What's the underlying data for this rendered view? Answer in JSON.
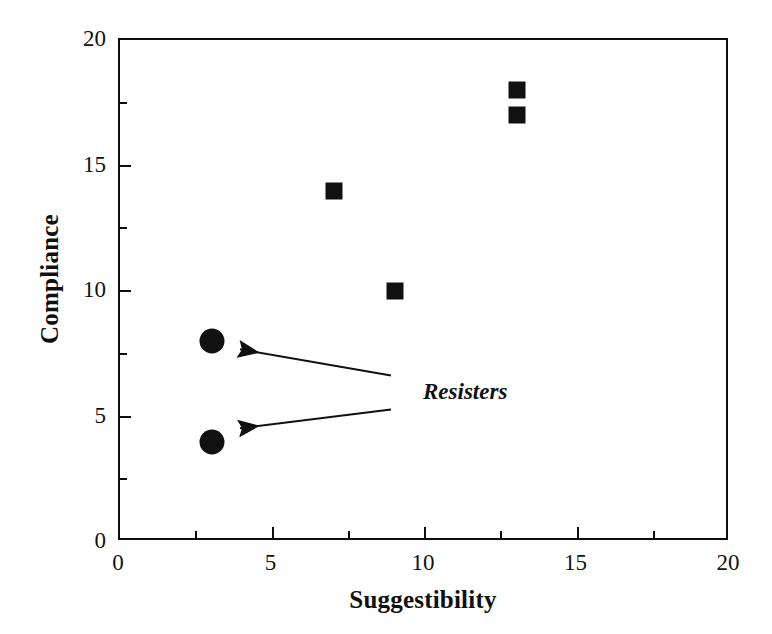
{
  "chart_data": {
    "type": "scatter",
    "title": "",
    "xlabel": "Suggestibility",
    "ylabel": "Compliance",
    "xlim": [
      0,
      20
    ],
    "ylim": [
      0,
      20
    ],
    "xticks": [
      0,
      5,
      10,
      15,
      20
    ],
    "yticks": [
      0,
      5,
      10,
      15,
      20
    ],
    "xtick_labels": [
      "0",
      "5",
      "10",
      "15",
      "20"
    ],
    "ytick_labels": [
      "0",
      "5",
      "10",
      "15",
      "20"
    ],
    "xminor_ticks": [
      2.5,
      7.5,
      12.5,
      17.5
    ],
    "yminor_ticks": [
      2.5,
      7.5,
      12.5,
      17.5
    ],
    "grid": false,
    "legend": false,
    "series": [
      {
        "name": "Compliers",
        "marker": "square",
        "color": "#111111",
        "points": [
          {
            "x": 7,
            "y": 14
          },
          {
            "x": 9,
            "y": 10
          },
          {
            "x": 13,
            "y": 18
          },
          {
            "x": 13,
            "y": 17
          }
        ]
      },
      {
        "name": "Resisters",
        "marker": "circle",
        "color": "#111111",
        "points": [
          {
            "x": 3,
            "y": 8
          },
          {
            "x": 3,
            "y": 4
          }
        ]
      }
    ],
    "annotations": [
      {
        "text": "Resisters",
        "x": 10.0,
        "y": 5.85,
        "arrows": [
          {
            "from_x": 8.95,
            "from_y": 6.55,
            "to_x": 4.0,
            "to_y": 7.6
          },
          {
            "from_x": 8.95,
            "from_y": 5.2,
            "to_x": 4.0,
            "to_y": 4.45
          }
        ]
      }
    ]
  }
}
